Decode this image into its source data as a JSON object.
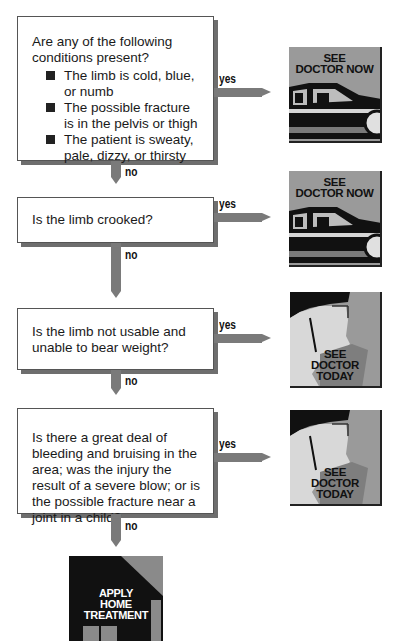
{
  "flowchart": {
    "steps": [
      {
        "question": "Are any of the following conditions present?",
        "conditions": [
          "The limb is cold, blue, or numb",
          "The possible fracture is in the pelvis or thigh",
          "The patient is sweaty, pale, dizzy, or thirsty"
        ],
        "yes_label": "yes",
        "no_label": "no",
        "yes_outcome": "SEE DOCTOR NOW"
      },
      {
        "question": "Is the limb crooked?",
        "yes_label": "yes",
        "no_label": "no",
        "yes_outcome": "SEE DOCTOR NOW"
      },
      {
        "question": "Is the limb not usable and unable to bear weight?",
        "yes_label": "yes",
        "no_label": "no",
        "yes_outcome": "SEE DOCTOR TODAY"
      },
      {
        "question": "Is there a great deal of bleeding and bruising in the area; was the injury the result of a severe blow; or is the possible fracture near a joint in a child?",
        "yes_label": "yes",
        "no_label": "no",
        "yes_outcome": "SEE DOCTOR TODAY"
      }
    ],
    "final_outcome": "APPLY HOME TREATMENT",
    "outcome_captions": {
      "now_line1": "SEE",
      "now_line2": "DOCTOR NOW",
      "today_line1": "SEE",
      "today_line2": "DOCTOR",
      "today_line3": "TODAY",
      "home_line1": "APPLY",
      "home_line2": "HOME",
      "home_line3": "TREATMENT"
    },
    "icons": {
      "now": "car-icon",
      "today": "face-profile-icon",
      "home": "house-icon"
    },
    "colors": {
      "arrow": "#7a7a7a",
      "box_shadow": "#6e6e6e",
      "picture_gray": "#9a9a9a",
      "home_black": "#111111"
    }
  }
}
